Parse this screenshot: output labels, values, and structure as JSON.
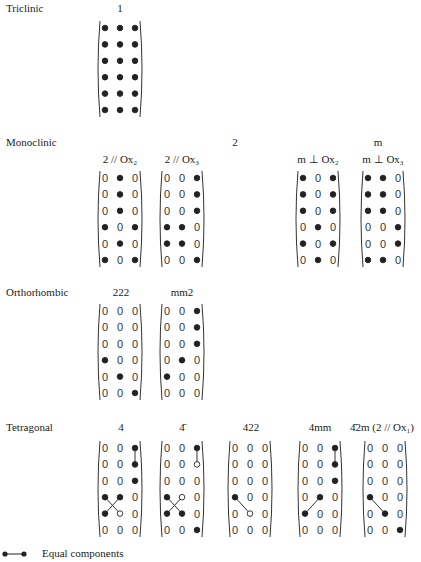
{
  "systems": [
    {
      "name": "Triclinic",
      "y": 2,
      "groups": [
        {
          "label": "1",
          "x": 120,
          "y": 2
        }
      ],
      "matrices": [
        {
          "x": 97,
          "y": 20,
          "sub": "",
          "rows": [
            "FFF",
            "FFF",
            "FFF",
            "FFF",
            "FFF",
            "FFF"
          ],
          "lines": []
        }
      ]
    },
    {
      "name": "Monoclinic",
      "y": 136,
      "groups": [
        {
          "label": "2",
          "x": 235,
          "y": 136
        },
        {
          "label": "m",
          "x": 378,
          "y": 136
        }
      ],
      "matrices": [
        {
          "x": 97,
          "y": 170,
          "sub": "2 // Ox₂",
          "rows": [
            "0F0",
            "0F0",
            "0F0",
            "F0F",
            "0F0",
            "F0F"
          ],
          "lines": []
        },
        {
          "x": 159,
          "y": 170,
          "sub": "2 // Ox₃",
          "rows": [
            "00F",
            "00F",
            "00F",
            "FF0",
            "FF0",
            "00F"
          ],
          "lines": []
        },
        {
          "x": 295,
          "y": 170,
          "sub": "m ⊥ Ox₂",
          "rows": [
            "F0F",
            "F0F",
            "F0F",
            "0F0",
            "F0F",
            "0F0"
          ],
          "lines": []
        },
        {
          "x": 360,
          "y": 170,
          "sub": "m ⊥ Ox₃",
          "rows": [
            "FF0",
            "FF0",
            "FF0",
            "00F",
            "00F",
            "FF0"
          ],
          "lines": []
        }
      ]
    },
    {
      "name": "Orthorhombic",
      "y": 286,
      "groups": [
        {
          "label": "222",
          "x": 121,
          "y": 286
        },
        {
          "label": "mm2",
          "x": 182,
          "y": 286
        }
      ],
      "matrices": [
        {
          "x": 97,
          "y": 303,
          "sub": "",
          "rows": [
            "000",
            "000",
            "000",
            "F00",
            "0F0",
            "00F"
          ],
          "lines": []
        },
        {
          "x": 159,
          "y": 303,
          "sub": "",
          "rows": [
            "00F",
            "00F",
            "00F",
            "0F0",
            "F00",
            "000"
          ],
          "lines": []
        }
      ]
    },
    {
      "name": "Tetragonal",
      "y": 421,
      "groups": [
        {
          "label": "4",
          "x": 121,
          "y": 421
        },
        {
          "label": "4̄",
          "x": 182,
          "y": 421
        },
        {
          "label": "422",
          "x": 251,
          "y": 421
        },
        {
          "label": "4mm",
          "x": 320,
          "y": 421
        },
        {
          "label": "4̄2m (2 // Ox₁)",
          "x": 382,
          "y": 421
        }
      ],
      "matrices": [
        {
          "x": 97,
          "y": 440,
          "sub": "",
          "rows": [
            "00F",
            "00F",
            "00F",
            "FF0",
            "FO0",
            "000"
          ],
          "lines": [
            [
              0,
              2,
              1,
              2
            ],
            [
              3,
              0,
              4,
              1
            ],
            [
              3,
              1,
              4,
              0
            ]
          ]
        },
        {
          "x": 159,
          "y": 440,
          "sub": "",
          "rows": [
            "00F",
            "00O",
            "000",
            "FO0",
            "FF0",
            "00F"
          ],
          "lines": [
            [
              0,
              2,
              1,
              2
            ],
            [
              3,
              0,
              4,
              1
            ],
            [
              3,
              1,
              4,
              0
            ]
          ]
        },
        {
          "x": 227,
          "y": 440,
          "sub": "",
          "rows": [
            "000",
            "000",
            "000",
            "F00",
            "0O0",
            "000"
          ],
          "lines": [
            [
              3,
              0,
              4,
              1
            ]
          ]
        },
        {
          "x": 297,
          "y": 440,
          "sub": "",
          "rows": [
            "00F",
            "00F",
            "00F",
            "0F0",
            "F00",
            "000"
          ],
          "lines": [
            [
              0,
              2,
              1,
              2
            ],
            [
              3,
              1,
              4,
              0
            ]
          ]
        },
        {
          "x": 362,
          "y": 440,
          "sub": "",
          "rows": [
            "000",
            "000",
            "000",
            "F00",
            "0F0",
            "00F"
          ],
          "lines": [
            [
              3,
              0,
              4,
              1
            ]
          ]
        }
      ]
    }
  ],
  "legend": {
    "text": "Equal components"
  },
  "colors": {
    "dot": "#222222",
    "text": "#222222"
  }
}
